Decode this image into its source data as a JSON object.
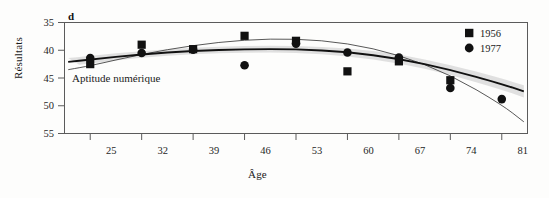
{
  "figure": {
    "panel_letter": "d",
    "annotation": "Aptitude numérique",
    "background_color": "#fdfdfc"
  },
  "axes": {
    "ylabel": "Résultats",
    "xlabel": "Âge",
    "y_ticks": [
      "55",
      "50",
      "45",
      "40",
      "35"
    ],
    "x_ticks": [
      "25",
      "32",
      "39",
      "46",
      "53",
      "60",
      "67",
      "74",
      "81"
    ]
  },
  "legend": {
    "position": "top-right",
    "entries": [
      {
        "label": "1956",
        "marker": "square-marker",
        "color": "#111111"
      },
      {
        "label": "1977",
        "marker": "circle-marker",
        "color": "#111111"
      }
    ]
  },
  "chart_data": {
    "type": "scatter",
    "title": "",
    "subtitle": "",
    "panel": "d",
    "annotation": "Aptitude numérique",
    "xlabel": "Âge",
    "ylabel": "Résultats",
    "xlim": [
      21.5,
      84.5
    ],
    "ylim": [
      35,
      55
    ],
    "xticks": [
      25,
      32,
      39,
      46,
      53,
      60,
      67,
      74,
      81
    ],
    "yticks": [
      35,
      40,
      45,
      50,
      55
    ],
    "grid": false,
    "legend_position": "top-right",
    "series": [
      {
        "name": "1956",
        "marker": "square",
        "color": "#111111",
        "x": [
          25,
          32,
          39,
          46,
          53,
          60,
          67,
          74
        ],
        "y": [
          47.5,
          51.0,
          50.2,
          52.6,
          51.7,
          46.2,
          48.0,
          44.6
        ]
      },
      {
        "name": "1977",
        "marker": "circle",
        "color": "#111111",
        "x": [
          25,
          32,
          39,
          46,
          53,
          60,
          67,
          74,
          81
        ],
        "y": [
          48.6,
          49.5,
          50.1,
          47.3,
          51.2,
          49.6,
          48.7,
          43.2,
          41.2
        ]
      }
    ],
    "fitted_curves": [
      {
        "name": "longitudinal-fit",
        "style": "thick",
        "color": "#111111",
        "x": [
          22,
          25,
          32,
          39,
          46,
          53,
          60,
          67,
          74,
          81,
          84
        ],
        "y": [
          47.9,
          48.3,
          49.3,
          49.9,
          50.2,
          50.2,
          49.7,
          48.5,
          46.5,
          43.9,
          42.6
        ]
      },
      {
        "name": "cross-sectional-fit",
        "style": "thin",
        "color": "#3a3a3a",
        "x": [
          22,
          25,
          32,
          39,
          46,
          53,
          60,
          67,
          74,
          81,
          84
        ],
        "y": [
          46.5,
          47.2,
          49.3,
          50.9,
          51.9,
          52.1,
          51.3,
          49.2,
          45.6,
          40.2,
          37.1
        ]
      }
    ],
    "confidence_band": {
      "name": "shaded-band",
      "color": "#c9c9c9",
      "x": [
        22,
        25,
        32,
        39,
        46,
        53,
        60,
        67,
        74,
        81,
        84
      ],
      "upper": [
        48.6,
        49.0,
        49.9,
        50.5,
        50.8,
        50.8,
        50.4,
        49.3,
        47.4,
        44.9,
        43.7
      ],
      "lower": [
        47.2,
        47.6,
        48.7,
        49.3,
        49.6,
        49.6,
        49.0,
        47.7,
        45.6,
        42.9,
        41.5
      ]
    }
  }
}
